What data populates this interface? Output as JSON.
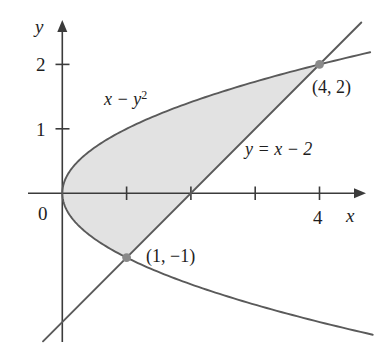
{
  "figure": {
    "background_color": "#ffffff",
    "curve_color": "#5a5a5a",
    "axis_color": "#3b3b3b",
    "shade_color": "#e2e2e2",
    "dot_color": "#8a8a8a"
  },
  "axes": {
    "x_axis_label": "x",
    "y_axis_label": "y",
    "origin_label": "0",
    "x_ticks": [
      {
        "value": 1,
        "label": ""
      },
      {
        "value": 2,
        "label": ""
      },
      {
        "value": 3,
        "label": ""
      },
      {
        "value": 4,
        "label": "4"
      }
    ],
    "y_ticks": [
      {
        "value": 1,
        "label": "1"
      },
      {
        "value": 2,
        "label": "2"
      }
    ],
    "x_range": [
      -0.35,
      5.1
    ],
    "y_range": [
      -2.4,
      2.6
    ]
  },
  "labels": {
    "parabola": {
      "base": "x − y",
      "exponent": "2"
    },
    "line": "y = x − 2",
    "point_upper": "(4, 2)",
    "point_lower": "(1, −1)"
  },
  "points": [
    {
      "name": "upper-intersection",
      "label": "(4, 2)",
      "x": 4,
      "y": 2
    },
    {
      "name": "lower-intersection",
      "label": "(1, −1)",
      "x": 1,
      "y": -1
    }
  ],
  "chart_data": {
    "type": "line",
    "title": "",
    "xlabel": "x",
    "ylabel": "y",
    "xlim": [
      -0.35,
      5.1
    ],
    "ylim": [
      -2.4,
      2.6
    ],
    "grid": false,
    "legend": "none",
    "series": [
      {
        "name": "x − y²",
        "kind": "parabola",
        "equation": "x = y^2",
        "y_domain": [
          -2.35,
          2.45
        ],
        "color": "#5a5a5a"
      },
      {
        "name": "y = x − 2",
        "kind": "line",
        "equation": "y = x - 2",
        "x_domain": [
          -0.3,
          4.65
        ],
        "color": "#5a5a5a"
      }
    ],
    "shaded_region": {
      "name": "region between parabola and line",
      "between": [
        "x = y^2",
        "y = x - 2"
      ],
      "y_from": -1,
      "y_to": 2,
      "fill": "#e2e2e2"
    },
    "annotations": [
      {
        "text": "x − y²",
        "x": 0.75,
        "y": 1.55
      },
      {
        "text": "y = x − 2",
        "x": 3.05,
        "y": 0.72
      },
      {
        "text": "(4, 2)",
        "x": 4.3,
        "y": 1.72
      },
      {
        "text": "(1, −1)",
        "x": 1.35,
        "y": -0.92
      }
    ],
    "x_tick_labels": [
      "",
      "",
      "",
      "4"
    ],
    "x_tick_values": [
      1,
      2,
      3,
      4
    ],
    "y_tick_labels": [
      "1",
      "2"
    ],
    "y_tick_values": [
      1,
      2
    ]
  }
}
